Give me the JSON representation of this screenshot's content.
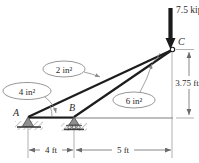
{
  "figure": {
    "type": "truss-free-body-diagram",
    "colors": {
      "member": "#1d1d1d",
      "ground_line": "#4a4a4a",
      "dimension": "#6a6a6a",
      "text": "#2b2b2b",
      "support_fill": "#8f8f8f",
      "hatch": "#b8b8b8",
      "load_arrow": "#1a1a1a"
    }
  },
  "load": {
    "label": "7.5 kips",
    "direction": "downward",
    "applied_at": "C"
  },
  "nodes": [
    {
      "id": "A",
      "label": "A",
      "support": "pin",
      "x_ft": 0,
      "y_ft": 0
    },
    {
      "id": "B",
      "label": "B",
      "support": "roller",
      "x_ft": 4,
      "y_ft": 0
    },
    {
      "id": "C",
      "label": "C",
      "support": "free-joint",
      "x_ft": 9,
      "y_ft": 3.75
    }
  ],
  "members": [
    {
      "from": "A",
      "to": "C",
      "area_label": "2 in²"
    },
    {
      "from": "B",
      "to": "C",
      "area_label": "6 in²"
    },
    {
      "from": "A",
      "to": "B",
      "area_label": "4 in²"
    }
  ],
  "callouts": [
    {
      "id": "area-ac",
      "text": "2 in²",
      "member": "AC"
    },
    {
      "id": "area-ab",
      "text": "4 in²",
      "member": "AB"
    },
    {
      "id": "area-bc",
      "text": "6 in²",
      "member": "BC"
    }
  ],
  "dimensions": [
    {
      "id": "dim-ab",
      "text": "4 ft",
      "orientation": "horizontal",
      "span": "A to B"
    },
    {
      "id": "dim-bc",
      "text": "5 ft",
      "orientation": "horizontal",
      "span": "B to C projection"
    },
    {
      "id": "dim-height",
      "text": "3.75 ft",
      "orientation": "vertical",
      "span": "baseline to C"
    }
  ]
}
